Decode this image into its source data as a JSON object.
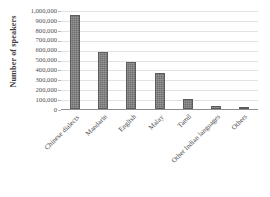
{
  "chart_data": {
    "type": "bar",
    "title": "",
    "subtitle": "",
    "xlabel": "",
    "ylabel": "Number of speakers",
    "categories": [
      "Chinese dialects",
      "Mandarin",
      "English",
      "Malay",
      "Tamil",
      "Other Indian languages",
      "Others"
    ],
    "values": [
      950000,
      575000,
      475000,
      365000,
      100000,
      30000,
      10000
    ],
    "ylim": [
      0,
      1000000
    ],
    "ytick_labels": [
      "1,000,000",
      "900,000",
      "800,000",
      "700,000",
      "600,000",
      "500,000",
      "400,000",
      "300,000",
      "200,000",
      "100,000",
      "0"
    ],
    "ytick_values": [
      1000000,
      900000,
      800000,
      700000,
      600000,
      500000,
      400000,
      300000,
      200000,
      100000,
      0
    ],
    "grid": true,
    "legend": false,
    "legend_position": "none",
    "series": [
      {
        "name": "Number of speakers",
        "color": "#6e6e6e",
        "values": [
          950000,
          575000,
          475000,
          365000,
          100000,
          30000,
          10000
        ]
      }
    ],
    "annotations": []
  }
}
